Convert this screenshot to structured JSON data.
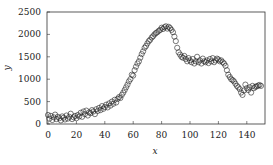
{
  "chart_data": {
    "type": "scatter",
    "title": "",
    "xlabel": "x",
    "ylabel": "y",
    "xlim": [
      0,
      150
    ],
    "ylim": [
      0,
      2500
    ],
    "xticks": [
      0,
      20,
      40,
      60,
      80,
      100,
      120,
      140
    ],
    "yticks": [
      0,
      500,
      1000,
      1500,
      2000,
      2500
    ],
    "grid": false,
    "legend": null,
    "marker": "open-circle",
    "marker_color": "#222222",
    "series": [
      {
        "name": "data",
        "x": [
          0,
          1,
          2,
          3,
          4,
          5,
          6,
          7,
          8,
          9,
          10,
          11,
          12,
          13,
          14,
          15,
          16,
          17,
          18,
          19,
          20,
          21,
          22,
          23,
          24,
          25,
          26,
          27,
          28,
          29,
          30,
          31,
          32,
          33,
          34,
          35,
          36,
          37,
          38,
          39,
          40,
          41,
          42,
          43,
          44,
          45,
          46,
          47,
          48,
          49,
          50,
          51,
          52,
          53,
          54,
          55,
          56,
          57,
          58,
          59,
          60,
          61,
          62,
          63,
          64,
          65,
          66,
          67,
          68,
          69,
          70,
          71,
          72,
          73,
          74,
          75,
          76,
          77,
          78,
          79,
          80,
          81,
          82,
          83,
          84,
          85,
          86,
          87,
          88,
          89,
          90,
          91,
          92,
          93,
          94,
          95,
          96,
          97,
          98,
          99,
          100,
          101,
          102,
          103,
          104,
          105,
          106,
          107,
          108,
          109,
          110,
          111,
          112,
          113,
          114,
          115,
          116,
          117,
          118,
          119,
          120,
          121,
          122,
          123,
          124,
          125,
          126,
          127,
          128,
          129,
          130,
          131,
          132,
          133,
          134,
          135,
          136,
          137,
          138,
          139,
          140,
          141,
          142,
          143,
          144,
          145,
          146,
          147,
          148,
          149,
          150
        ],
        "y": [
          200,
          120,
          180,
          90,
          150,
          210,
          110,
          160,
          130,
          80,
          170,
          140,
          100,
          190,
          120,
          160,
          230,
          110,
          150,
          180,
          130,
          200,
          170,
          250,
          160,
          280,
          220,
          300,
          190,
          260,
          240,
          310,
          280,
          220,
          330,
          290,
          360,
          310,
          400,
          340,
          380,
          430,
          370,
          460,
          410,
          500,
          450,
          540,
          480,
          560,
          600,
          580,
          650,
          700,
          760,
          820,
          880,
          950,
          1000,
          1100,
          1080,
          1200,
          1280,
          1350,
          1400,
          1480,
          1560,
          1620,
          1700,
          1740,
          1800,
          1850,
          1880,
          1930,
          1960,
          2000,
          2030,
          2050,
          2080,
          2100,
          2150,
          2120,
          2160,
          2180,
          2130,
          2170,
          2140,
          2100,
          2050,
          1950,
          1850,
          1700,
          1600,
          1550,
          1500,
          1480,
          1520,
          1450,
          1400,
          1470,
          1420,
          1380,
          1450,
          1350,
          1400,
          1500,
          1380,
          1420,
          1350,
          1460,
          1400,
          1380,
          1420,
          1360,
          1450,
          1400,
          1470,
          1380,
          1420,
          1460,
          1440,
          1400,
          1420,
          1380,
          1350,
          1300,
          1200,
          1100,
          1050,
          1000,
          980,
          950,
          900,
          850,
          820,
          780,
          700,
          650,
          750,
          880,
          800,
          760,
          820,
          700,
          850,
          800,
          830,
          840,
          860,
          870,
          850
        ]
      }
    ]
  }
}
